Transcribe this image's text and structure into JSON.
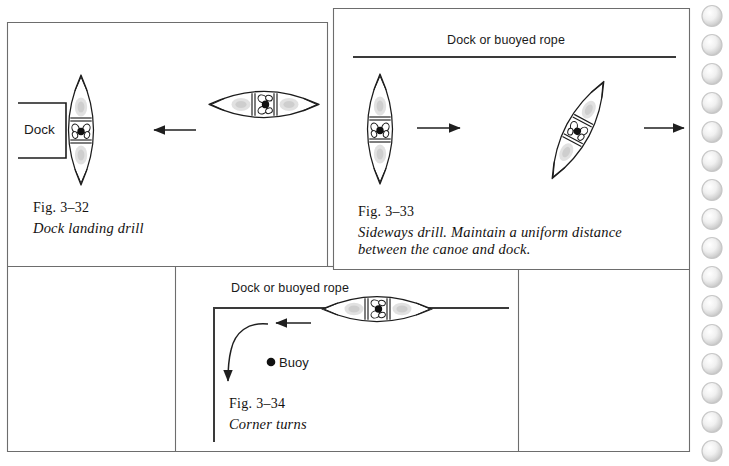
{
  "page": {
    "background_color": "#ffffff",
    "ink_color": "#2b2b2b",
    "binding_hole_color": "#cccccc",
    "width": 729,
    "height": 466
  },
  "panels": [
    {
      "id": "fig-3-32",
      "figure_number": "Fig. 3–32",
      "caption": "Dock landing drill",
      "labels": {
        "dock": "Dock"
      },
      "arrow_direction": "left"
    },
    {
      "id": "fig-3-33",
      "figure_number": "Fig. 3–33",
      "caption_line1": "Sideways drill. Maintain a uniform distance",
      "caption_line2": "between the canoe and dock.",
      "labels": {
        "dock_rope": "Dock or buoyed rope"
      },
      "arrow_direction": "right"
    },
    {
      "id": "fig-3-34",
      "figure_number": "Fig. 3–34",
      "caption": "Corner turns",
      "labels": {
        "dock_rope": "Dock or buoyed rope",
        "buoy": "Buoy"
      },
      "arrow_direction": "left"
    }
  ],
  "binding": {
    "hole_count": 16,
    "first_hole_y": 16,
    "spacing": 29
  }
}
